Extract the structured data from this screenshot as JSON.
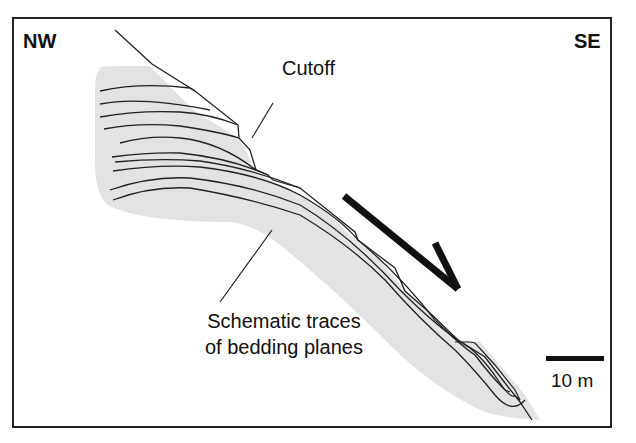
{
  "diagram": {
    "directions": {
      "left": "NW",
      "right": "SE"
    },
    "labels": {
      "cutoff": "Cutoff",
      "bedding_line1": "Schematic traces",
      "bedding_line2": "of bedding planes"
    },
    "scale_bar": {
      "label": "10 m"
    },
    "arrow": {
      "meaning": "downslope movement direction",
      "direction": "SE"
    },
    "colors": {
      "fill": "#e3e3e3",
      "line": "#222222",
      "arrow": "#111111",
      "background": "#ffffff"
    }
  }
}
